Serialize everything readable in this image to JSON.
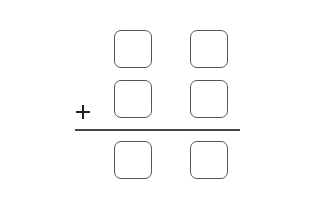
{
  "problem": {
    "operation": "addition",
    "operator_symbol": "+",
    "columns": 2,
    "rows": {
      "addend_1": [
        "",
        ""
      ],
      "addend_2": [
        "",
        ""
      ],
      "sum": [
        "",
        ""
      ]
    }
  },
  "colors": {
    "box_border": "#555555",
    "rule": "#444444",
    "operator": "#222222",
    "background": "#ffffff"
  }
}
